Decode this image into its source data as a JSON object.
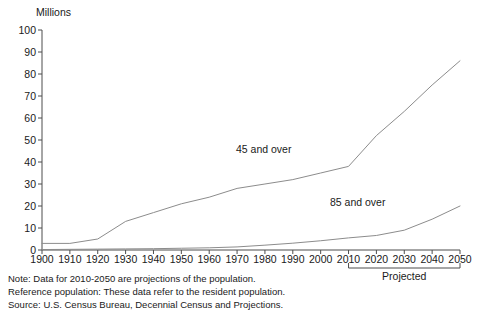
{
  "chart_data": {
    "type": "line",
    "title": "",
    "xlabel": "",
    "ylabel": "Millions",
    "ylim": [
      0,
      100
    ],
    "xlim": [
      1900,
      2050
    ],
    "grid": false,
    "legend_position": "inline-annotations",
    "y_ticks": [
      0,
      10,
      20,
      30,
      40,
      50,
      60,
      70,
      80,
      90,
      100
    ],
    "x_ticks": [
      1900,
      1910,
      1920,
      1930,
      1940,
      1950,
      1960,
      1970,
      1980,
      1990,
      2000,
      2010,
      2020,
      2030,
      2040,
      2050
    ],
    "x": [
      1900,
      1910,
      1920,
      1930,
      1940,
      1950,
      1960,
      1970,
      1980,
      1990,
      2000,
      2010,
      2020,
      2030,
      2040,
      2050
    ],
    "series": [
      {
        "name": "45 and over",
        "values": [
          3,
          3,
          5,
          13,
          17,
          21,
          24,
          28,
          30,
          32,
          35,
          38,
          52,
          63,
          75,
          86
        ]
      },
      {
        "name": "85 and over",
        "values": [
          0.2,
          0.3,
          0.4,
          0.5,
          0.6,
          0.8,
          1.0,
          1.4,
          2.2,
          3.1,
          4.2,
          5.5,
          6.6,
          9.0,
          14.0,
          20.0
        ]
      }
    ],
    "annotations": [
      {
        "text": "45 and over",
        "x": 1985,
        "y": 38
      },
      {
        "text": "85 and over",
        "x": 2018,
        "y": 16
      },
      {
        "text": "Projected",
        "x": 2030,
        "y": -18
      }
    ],
    "projected_range": [
      2010,
      2050
    ],
    "line_color": "#8c8c8c",
    "axis_color": "#4d4d4d"
  },
  "axis": {
    "unit_label": "Millions",
    "y_tick_labels": [
      "100",
      "90",
      "80",
      "70",
      "60",
      "50",
      "40",
      "30",
      "20",
      "10",
      "0"
    ],
    "x_tick_labels": [
      "1900",
      "1910",
      "1920",
      "1930",
      "1940",
      "1950",
      "1960",
      "1970",
      "1980",
      "1990",
      "2000",
      "2010",
      "2020",
      "2030",
      "2040",
      "2050"
    ]
  },
  "labels": {
    "series_45": "45 and over",
    "series_85": "85 and over",
    "projected": "Projected"
  },
  "footnotes": {
    "note": "Note: Data for 2010-2050 are projections of the population.",
    "reference": "Reference population: These data refer to the resident population.",
    "source": "Source: U.S. Census Bureau, Decennial Census and Projections."
  }
}
